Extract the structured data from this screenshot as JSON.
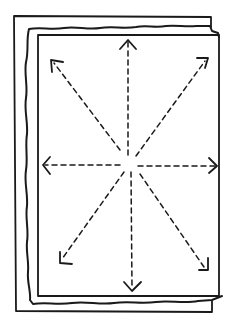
{
  "diagram": {
    "colors": {
      "ink": "#1a1a1a",
      "background": "#ffffff"
    },
    "center": [
      130,
      163
    ],
    "arrows": [
      {
        "name": "arrow-up",
        "tip": [
          128,
          40
        ]
      },
      {
        "name": "arrow-down",
        "tip": [
          132,
          290
        ]
      },
      {
        "name": "arrow-left",
        "tip": [
          43,
          165
        ]
      },
      {
        "name": "arrow-right",
        "tip": [
          217,
          166
        ]
      },
      {
        "name": "arrow-up-left",
        "tip": [
          51,
          60
        ]
      },
      {
        "name": "arrow-up-right",
        "tip": [
          208,
          58
        ]
      },
      {
        "name": "arrow-down-left",
        "tip": [
          60,
          262
        ]
      },
      {
        "name": "arrow-down-right",
        "tip": [
          207,
          270
        ]
      }
    ]
  }
}
